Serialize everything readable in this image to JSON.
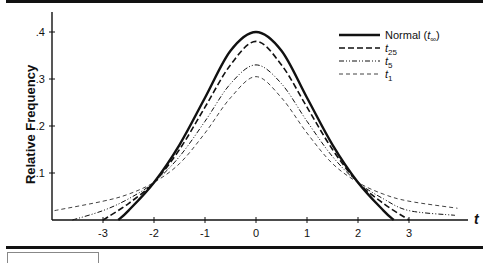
{
  "chart_data": {
    "type": "line",
    "title": "",
    "xlabel": "t",
    "ylabel": "Relative Frequency",
    "xlim": [
      -4,
      4
    ],
    "ylim": [
      0,
      0.44
    ],
    "grid": false,
    "legend_position": "upper right",
    "x_ticks": [
      -3,
      -2,
      -1,
      0,
      1,
      2,
      3
    ],
    "x_tick_labels": [
      "-3",
      "-2",
      "-1",
      "0",
      "1",
      "2",
      "3"
    ],
    "y_ticks": [
      0.1,
      0.2,
      0.3,
      0.4
    ],
    "y_tick_labels": [
      ".1",
      ".2",
      ".3",
      ".4"
    ],
    "series": [
      {
        "name": "Normal (t∞)",
        "legend_main": "Normal (",
        "legend_sub": "∞",
        "legend_tail": ")",
        "style": "solid",
        "width": 2.4,
        "x": [
          -2.7,
          -2.5,
          -2,
          -1.5,
          -1,
          -0.5,
          0,
          0.5,
          1,
          1.5,
          2,
          2.5,
          2.7
        ],
        "values": [
          0,
          0.02,
          0.08,
          0.16,
          0.26,
          0.36,
          0.4,
          0.36,
          0.26,
          0.16,
          0.08,
          0.02,
          0
        ]
      },
      {
        "name": "t25",
        "legend_main": "",
        "legend_sub": "25",
        "legend_tail": "",
        "style": "dashed",
        "width": 1.6,
        "x": [
          -3.0,
          -2.5,
          -2,
          -1.5,
          -1,
          -0.5,
          0,
          0.5,
          1,
          1.5,
          2,
          2.5,
          3.0
        ],
        "values": [
          0,
          0.035,
          0.08,
          0.15,
          0.24,
          0.33,
          0.38,
          0.33,
          0.24,
          0.15,
          0.08,
          0.035,
          0
        ]
      },
      {
        "name": "t5",
        "legend_main": "",
        "legend_sub": "5",
        "legend_tail": "",
        "style": "dashdotdot",
        "width": 1,
        "x": [
          -3.6,
          -3,
          -2.5,
          -2,
          -1.5,
          -1,
          -0.5,
          0,
          0.5,
          1,
          1.5,
          2,
          2.5,
          3,
          3.9
        ],
        "values": [
          0,
          0.02,
          0.045,
          0.08,
          0.135,
          0.21,
          0.29,
          0.33,
          0.29,
          0.21,
          0.135,
          0.08,
          0.045,
          0.02,
          0.01
        ]
      },
      {
        "name": "t1",
        "legend_main": "",
        "legend_sub": "1",
        "legend_tail": "",
        "style": "thin-dashed",
        "width": 0.8,
        "x": [
          -3.95,
          -3,
          -2.5,
          -2,
          -1.5,
          -1,
          -0.5,
          0,
          0.5,
          1,
          1.5,
          2,
          2.5,
          3,
          3.95
        ],
        "values": [
          0.02,
          0.04,
          0.055,
          0.08,
          0.12,
          0.185,
          0.26,
          0.305,
          0.26,
          0.185,
          0.12,
          0.08,
          0.055,
          0.04,
          0.025
        ]
      }
    ]
  },
  "axes": {
    "x_axis_label": "t",
    "y_axis_label": "Relative Frequency"
  }
}
